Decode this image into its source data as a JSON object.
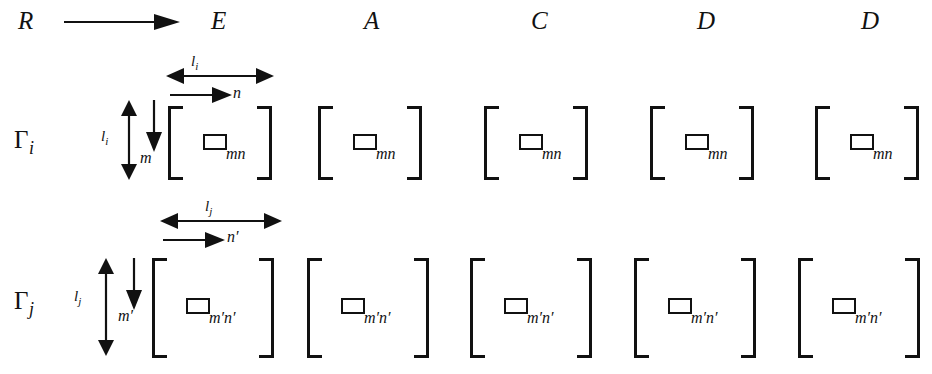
{
  "figure": {
    "background_color": "#ffffff",
    "ink_color": "#111111"
  },
  "header": {
    "row_source_label": "R",
    "arrow_icon": "right-arrow-icon",
    "columns": [
      {
        "label": "E"
      },
      {
        "label": "A"
      },
      {
        "label": "C"
      },
      {
        "label": "D"
      },
      {
        "label": "D"
      }
    ]
  },
  "rows": [
    {
      "id": "gamma-i",
      "label_base": "Γ",
      "label_sub": "i",
      "height_label": "l",
      "height_label_sub": "i",
      "width_label": "l",
      "width_label_sub": "i",
      "row_index_label": "m",
      "col_index_label": "n",
      "cell_subscript": "mn",
      "matrices": [
        {
          "column": "E",
          "cell_subscript": "mn"
        },
        {
          "column": "A",
          "cell_subscript": "mn"
        },
        {
          "column": "C",
          "cell_subscript": "mn"
        },
        {
          "column": "D",
          "cell_subscript": "mn"
        },
        {
          "column": "D",
          "cell_subscript": "mn"
        }
      ]
    },
    {
      "id": "gamma-j",
      "label_base": "Γ",
      "label_sub": "j",
      "height_label": "l",
      "height_label_sub": "j",
      "width_label": "l",
      "width_label_sub": "j",
      "row_index_label": "m′",
      "col_index_label": "n′",
      "cell_subscript": "m′n′",
      "matrices": [
        {
          "column": "E",
          "cell_subscript": "m′n′"
        },
        {
          "column": "A",
          "cell_subscript": "m′n′"
        },
        {
          "column": "C",
          "cell_subscript": "m′n′"
        },
        {
          "column": "D",
          "cell_subscript": "m′n′"
        },
        {
          "column": "D",
          "cell_subscript": "m′n′"
        }
      ]
    }
  ]
}
